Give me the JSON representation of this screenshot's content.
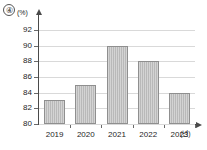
{
  "marker": {
    "label": "④",
    "name": "choice-number-4"
  },
  "chart_data": {
    "type": "bar",
    "title": "",
    "subtitle": "",
    "categories": [
      "2019",
      "2020",
      "2021",
      "2022",
      "2023"
    ],
    "values": [
      83,
      85,
      90,
      88,
      84
    ],
    "series": [
      {
        "name": "",
        "values": [
          83,
          85,
          90,
          88,
          84
        ]
      }
    ],
    "xlabel": "(년)",
    "ylabel": "(%)",
    "ylim": [
      80,
      93
    ],
    "yticks": [
      80,
      82,
      84,
      86,
      88,
      90,
      92
    ],
    "ytick_labels": [
      "80",
      "82",
      "84",
      "86",
      "88",
      "90",
      "92"
    ],
    "grid": true,
    "grid_axis": "y",
    "legend": false,
    "legend_position": "none",
    "bar_color": "#b9b9b9",
    "bar_border_color": "#8f8f8f",
    "gridline_color": "#d9d9d9",
    "axis_color": "#4a4a4a",
    "annotations": []
  }
}
